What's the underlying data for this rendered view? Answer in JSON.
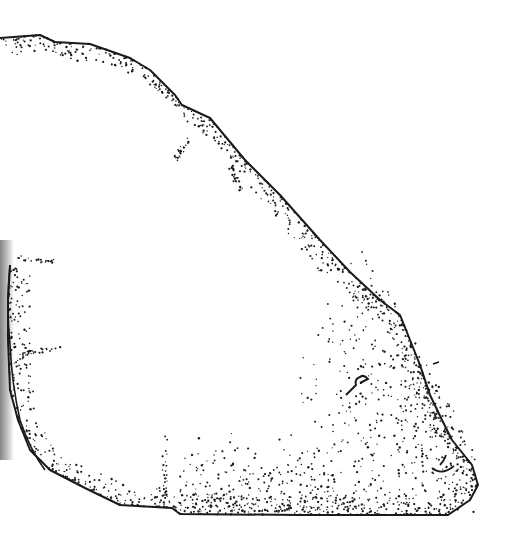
{
  "illustration": {
    "subject": "stippled anatomical section drawing",
    "style": "pen-and-ink stipple",
    "colors": {
      "background": "#ffffff",
      "ink": "#1a1a1a"
    },
    "outline": [
      [
        0,
        38
      ],
      [
        40,
        35
      ],
      [
        55,
        42
      ],
      [
        90,
        44
      ],
      [
        130,
        58
      ],
      [
        150,
        70
      ],
      [
        175,
        95
      ],
      [
        182,
        105
      ],
      [
        210,
        118
      ],
      [
        245,
        160
      ],
      [
        280,
        195
      ],
      [
        320,
        240
      ],
      [
        350,
        272
      ],
      [
        380,
        300
      ],
      [
        400,
        315
      ],
      [
        420,
        365
      ],
      [
        430,
        395
      ],
      [
        442,
        420
      ],
      [
        452,
        440
      ],
      [
        472,
        465
      ],
      [
        478,
        485
      ],
      [
        470,
        500
      ],
      [
        448,
        515
      ],
      [
        300,
        515
      ],
      [
        180,
        514
      ],
      [
        172,
        508
      ],
      [
        120,
        505
      ],
      [
        85,
        488
      ],
      [
        50,
        470
      ],
      [
        30,
        450
      ],
      [
        18,
        420
      ],
      [
        10,
        390
      ],
      [
        8,
        340
      ],
      [
        8,
        300
      ],
      [
        10,
        265
      ]
    ],
    "stipple_density": {
      "top_rim": 0.6,
      "right_lobe": 0.9,
      "bottom_rim": 0.5,
      "left_edge": 0.7
    }
  }
}
